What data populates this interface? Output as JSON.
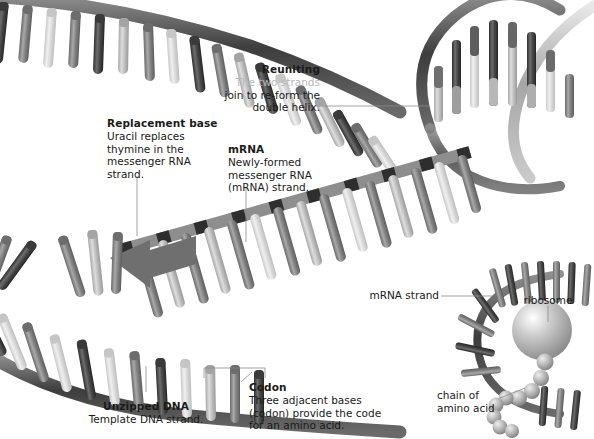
{
  "figure": {
    "background_color": "#ffffff",
    "ink_color": "#1a1a1a"
  },
  "labels": {
    "reuniting": {
      "heading": "Reuniting",
      "line1": "The two strands",
      "line2": "join to re-form the",
      "line3": "double helix."
    },
    "replacement_base": {
      "heading": "Replacement base",
      "line1": "Uracil replaces",
      "line2": "thymine in the",
      "line3": "messenger RNA",
      "line4": "strand."
    },
    "mrna": {
      "heading": "mRNA",
      "line1": "Newly-formed",
      "line2": "messenger RNA",
      "line3": "(mRNA) strand."
    },
    "codon": {
      "heading": "Codon",
      "line1": "Three adjacent bases",
      "line2": "(codon) provide the code",
      "line3": "for an amino acid."
    },
    "unzipped_dna": {
      "heading": "Unzipped DNA",
      "line1": "Template DNA strand."
    },
    "mrna_strand": {
      "text": "mRNA strand"
    },
    "ribosome": {
      "text": "ribosome"
    },
    "amino_chain": {
      "line1": "chain of",
      "line2": "amino acid"
    }
  },
  "colors": {
    "backbone_dark": "#4a4a4a",
    "backbone_mid": "#7d7d7d",
    "backbone_light": "#b5b5b5",
    "base_dark": "#555555",
    "base_mid": "#8c8c8c",
    "base_light": "#cfcfcf",
    "base_pale": "#e4e4e4",
    "ribosome": "#b0b0b0",
    "leader_line": "#8a8a8a"
  }
}
